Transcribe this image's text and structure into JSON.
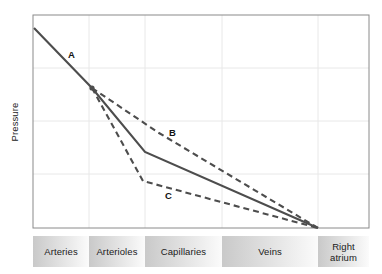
{
  "chart_data": {
    "type": "line",
    "title": "",
    "xlabel": "",
    "ylabel": "Pressure",
    "grid": true,
    "legend_position": "inline-annotations",
    "x_categories": [
      "Arteries",
      "Arterioles",
      "Capillaries",
      "Veins",
      "Right atrium"
    ],
    "x_category_boundaries_px": [
      33,
      89,
      145,
      222,
      318,
      369
    ],
    "axis_ranges": {
      "x": [
        0,
        100
      ],
      "y": [
        0,
        100
      ]
    },
    "gridlines": {
      "horizontal_count": 4,
      "vertical_count": 4
    },
    "annotations": [
      {
        "label": "A",
        "x_px": 72,
        "y_px": 56
      },
      {
        "label": "B",
        "x_px": 173,
        "y_px": 134
      },
      {
        "label": "C",
        "x_px": 170,
        "y_px": 197
      }
    ],
    "series": [
      {
        "name": "A",
        "style": "solid",
        "color": "#4d4d4d",
        "description": "Normal systemic pressure profile: steep fall across arterioles, moderate fall across capillaries and veins",
        "points_px": [
          [
            34,
            28
          ],
          [
            92,
            88
          ],
          [
            145,
            152
          ],
          [
            318,
            228
          ]
        ],
        "points_data": [
          [
            0.3,
            93.7
          ],
          [
            17.6,
            71.6
          ],
          [
            33.3,
            48.1
          ],
          [
            84.8,
            20.0
          ]
        ]
      },
      {
        "name": "B",
        "style": "dashed",
        "color": "#4d4d4d",
        "description": "Elevated downstream pressure curve lying above the normal (solid) curve",
        "points_px": [
          [
            92,
            88
          ],
          [
            159,
            133
          ],
          [
            318,
            228
          ]
        ],
        "points_data": [
          [
            17.6,
            71.6
          ],
          [
            37.5,
            55.0
          ],
          [
            84.8,
            20.0
          ]
        ]
      },
      {
        "name": "C",
        "style": "dashed",
        "color": "#4d4d4d",
        "description": "Depressed downstream pressure curve lying below the normal (solid) curve",
        "points_px": [
          [
            92,
            88
          ],
          [
            143,
            181
          ],
          [
            318,
            228
          ]
        ],
        "points_data": [
          [
            17.6,
            71.6
          ],
          [
            32.7,
            37.3
          ],
          [
            84.8,
            20.0
          ]
        ]
      }
    ]
  },
  "plot": {
    "y_axis_title": "Pressure",
    "frame": {
      "left": 33,
      "top": 15,
      "right": 369,
      "bottom": 228
    },
    "border_color": "#7a7a7a",
    "grid_color": "#e6e6e6",
    "line_color": "#4d4d4d"
  },
  "labels": {
    "a": "A",
    "b": "B",
    "c": "C"
  },
  "band": {
    "segments": [
      {
        "label": "Arteries",
        "width_px": 56
      },
      {
        "label": "Arterioles",
        "width_px": 56
      },
      {
        "label": "Capillaries",
        "width_px": 77
      },
      {
        "label": "Veins",
        "width_px": 96
      },
      {
        "label": "Right atrium",
        "width_px": 51
      }
    ],
    "fill_start": "#c9c9c9",
    "fill_end": "#fbfbfb"
  }
}
